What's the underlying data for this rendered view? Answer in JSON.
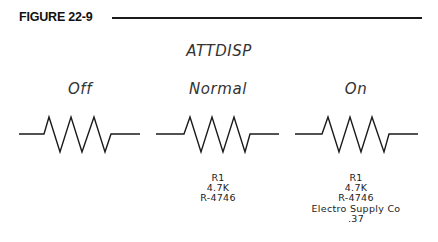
{
  "figure": {
    "label": "FIGURE 22-9",
    "title": "ATTDISP"
  },
  "panels": [
    {
      "mode": "Off",
      "attributes": []
    },
    {
      "mode": "Normal",
      "attributes": [
        "R1",
        "4.7K",
        "R-4746"
      ]
    },
    {
      "mode": "On",
      "attributes": [
        "R1",
        "4.7K",
        "R-4746",
        "Electro Supply Co",
        ".37"
      ]
    }
  ],
  "symbol": "resistor"
}
